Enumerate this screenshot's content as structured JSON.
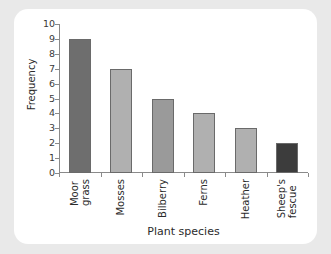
{
  "chart_data": {
    "type": "bar",
    "title": "",
    "subtitle": "",
    "xlabel": "Plant species",
    "ylabel": "Frequency",
    "categories": [
      "Moor grass",
      "Mosses",
      "Bilberry",
      "Ferns",
      "Heather",
      "Sheep's fescue"
    ],
    "category_lines": [
      [
        "Moor",
        "grass"
      ],
      [
        "Mosses",
        ""
      ],
      [
        "Bilberry",
        ""
      ],
      [
        "Ferns",
        ""
      ],
      [
        "Heather",
        ""
      ],
      [
        "Sheep's",
        "fescue"
      ]
    ],
    "values": [
      9,
      7,
      5,
      4,
      3,
      2
    ],
    "bar_colors": [
      "#6e6e6e",
      "#b0b0b0",
      "#9a9a9a",
      "#b0b0b0",
      "#b0b0b0",
      "#3c3c3c"
    ],
    "ylim": [
      0,
      10
    ],
    "ytick_labels": [
      "0",
      "1",
      "2",
      "3",
      "4",
      "5",
      "6",
      "7",
      "8",
      "9",
      "10"
    ],
    "ytick_values": [
      0,
      1,
      2,
      3,
      4,
      5,
      6,
      7,
      8,
      9,
      10
    ],
    "grid": false,
    "legend": "none",
    "axis_color": "#8a8a8a",
    "background": "#ffffff",
    "page_background": "#e9e9e9"
  }
}
